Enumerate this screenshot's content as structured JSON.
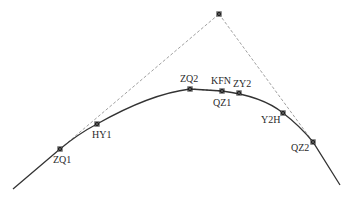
{
  "diagram": {
    "type": "road-curve-alignment",
    "colors": {
      "curve": "#333333",
      "tangent": "#888888",
      "marker": "#222222",
      "background": "#ffffff"
    },
    "apex": {
      "x": 219,
      "y": 14
    },
    "curve_path": "M13,189 L60,149 Q78,134 97,124 Q150,94 190,89 L222,91 Q262,96 283,113 Q300,126 313,142 L340,185",
    "tangent_left": {
      "x1": 60,
      "y1": 149,
      "x2": 219,
      "y2": 14
    },
    "tangent_right": {
      "x1": 219,
      "y1": 14,
      "x2": 313,
      "y2": 142
    },
    "points": [
      {
        "id": "ZQ1",
        "label": "ZQ1",
        "x": 60,
        "y": 149,
        "lx": 53,
        "ly": 163
      },
      {
        "id": "HY1",
        "label": "HY1",
        "x": 97,
        "y": 124,
        "lx": 92,
        "ly": 138
      },
      {
        "id": "ZQ2",
        "label": "ZQ2",
        "x": 190,
        "y": 89,
        "lx": 180,
        "ly": 82
      },
      {
        "id": "KFN",
        "label": "KFN",
        "x": 222,
        "y": 91,
        "lx": 211,
        "ly": 84
      },
      {
        "id": "QZ1",
        "label": "QZ1",
        "x": 222,
        "y": 91,
        "lx": 213,
        "ly": 106
      },
      {
        "id": "ZY2",
        "label": "ZY2",
        "x": 239,
        "y": 93,
        "lx": 233,
        "ly": 87
      },
      {
        "id": "Y2H",
        "label": "Y2H",
        "x": 283,
        "y": 113,
        "lx": 261,
        "ly": 123
      },
      {
        "id": "QZ2",
        "label": "QZ2",
        "x": 313,
        "y": 142,
        "lx": 291,
        "ly": 151
      }
    ],
    "dashed_segment_zq2_kfn": {
      "x1": 190,
      "y1": 89,
      "x2": 222,
      "y2": 91
    }
  }
}
